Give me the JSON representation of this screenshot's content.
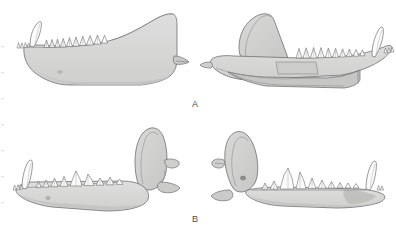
{
  "figure": {
    "kind": "scientific-line-drawing",
    "background_color": "#ffffff",
    "outline_color": "#6b6b6b",
    "bone_fill_color": "#d8d8d6",
    "bone_fill_shadow": "#c4c4c2",
    "tooth_fill_color": "#fbfbfa",
    "label_color": "#4a4a4a"
  },
  "panels": [
    {
      "id": "panel-a",
      "label": "A",
      "specimens": [
        {
          "id": "a-left",
          "name": "left mandible lateral view",
          "features": [
            "canine",
            "premolar row",
            "molar row",
            "coronoid process",
            "angular process",
            "mental foramen"
          ]
        },
        {
          "id": "a-right",
          "name": "right mandible medial view",
          "features": [
            "canine",
            "incisors",
            "tooth row",
            "coronoid process",
            "ramus",
            "angular process"
          ]
        }
      ]
    },
    {
      "id": "panel-b",
      "label": "B",
      "specimens": [
        {
          "id": "b-left",
          "name": "left mandible lateral view",
          "features": [
            "canine",
            "premolars",
            "carnassial",
            "molars",
            "coronoid process",
            "condyle",
            "angular process",
            "mental foramen"
          ]
        },
        {
          "id": "b-right",
          "name": "right mandible lateral view",
          "features": [
            "coronoid process",
            "condyle",
            "angular process",
            "molars",
            "carnassial",
            "premolars",
            "canine",
            "mental foramen"
          ]
        }
      ]
    }
  ],
  "labels": {
    "a": "A",
    "b": "B"
  }
}
